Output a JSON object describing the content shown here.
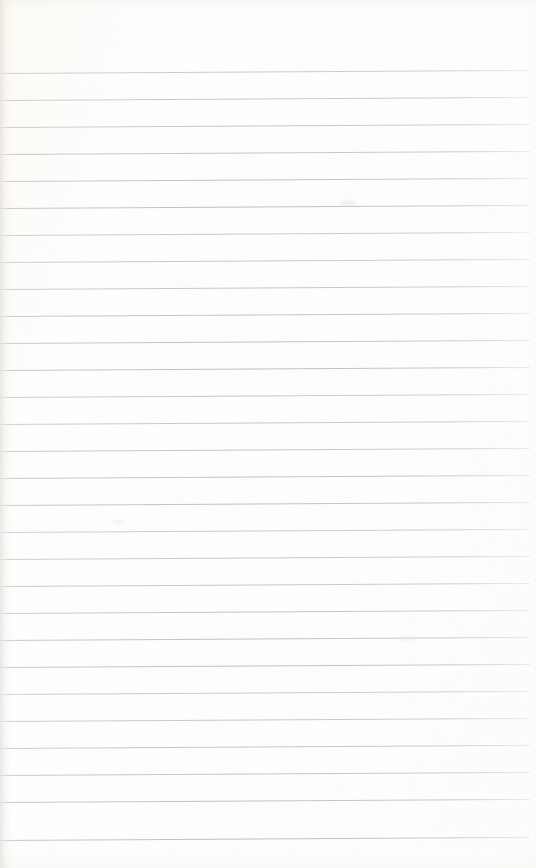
{
  "document": {
    "kind": "scanned-page",
    "subject": "blank ruled notepad page",
    "title": "",
    "body_text": "",
    "written_content": "",
    "has_handwriting": false,
    "has_printed_text": false,
    "page_number": "",
    "header_text": "",
    "footer_text": ""
  },
  "page": {
    "width": 536,
    "height": 868,
    "background_color": "#fdfdfd",
    "paper_tint_color": "#fcfaf3",
    "edge_shadow_color": "#d0ccc0"
  },
  "ruling": {
    "type": "horizontal-ruled",
    "line_color": "#b8bdc7",
    "line_thickness_px": 1,
    "line_spacing_px": 27,
    "first_line_y": 73,
    "last_line_y": 840,
    "line_count": 29,
    "line_start_x": 0,
    "line_end_x": 530,
    "skew_rise_px": 3,
    "margin_top_px": 73,
    "margin_bottom_px": 28,
    "margin_left_px": 0,
    "margin_right_px": 6,
    "has_vertical_margin_rule": false,
    "lines_y": [
      73,
      100,
      127,
      154,
      181,
      208,
      235,
      262,
      289,
      316,
      343,
      370,
      397,
      424,
      451,
      478,
      505,
      532,
      559,
      586,
      613,
      640,
      667,
      694,
      721,
      748,
      775,
      802,
      840
    ]
  },
  "artifacts": {
    "smudges": [
      {
        "x": 340,
        "y": 201,
        "w": 16,
        "h": 5,
        "color": "rgba(226,224,217,0.55)"
      },
      {
        "x": 112,
        "y": 520,
        "w": 13,
        "h": 4,
        "color": "rgba(230,228,221,0.45)"
      },
      {
        "x": 398,
        "y": 636,
        "w": 18,
        "h": 5,
        "color": "rgba(231,229,222,0.40)"
      }
    ]
  }
}
